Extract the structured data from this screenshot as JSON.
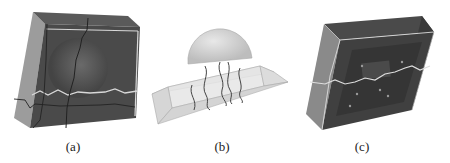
{
  "figure": {
    "panels": [
      {
        "id": "a",
        "label": "(a)",
        "description": "Dark block with curved inner surface and crack lines, light fracture line across middle"
      },
      {
        "id": "b",
        "label": "(b)",
        "description": "Transparent trapezoidal prism with hemisphere on top and wavy vertical strands"
      },
      {
        "id": "c",
        "label": "(c)",
        "description": "Dark block with inner recess, light fracture line and scattered point markers"
      }
    ],
    "colors": {
      "block_dark": "#4a4a4a",
      "block_side": "#9a9a9a",
      "crack_dark": "#222222",
      "fracture_light": "#d8d8d8",
      "prism_fill": "#e4e4e4",
      "hemisphere": "#d0d0d0"
    }
  }
}
